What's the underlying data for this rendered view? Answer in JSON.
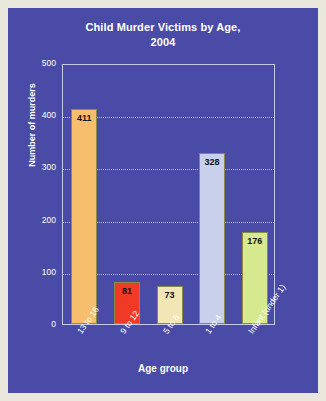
{
  "panel": {
    "background_color": "#4a4ba6",
    "page_background_color": "#eae7dd",
    "frame_color": "#c6c9e8",
    "gridline_color": "#b9bde4"
  },
  "chart_data": {
    "type": "bar",
    "title": "Child Murder Victims by Age,",
    "title_line2": "2004",
    "subtitle": "",
    "categories": [
      "13 to 16",
      "9 to 12",
      "5 to 8",
      "1 to 4",
      "Infant (under 1)"
    ],
    "values": [
      411,
      81,
      73,
      328,
      176
    ],
    "value_labels": [
      "411",
      "81",
      "73",
      "328",
      "176"
    ],
    "xlabel": "Age group",
    "ylabel": "Number of murders",
    "ylim": [
      0,
      500
    ],
    "yticks": [
      0,
      100,
      200,
      300,
      400,
      500
    ],
    "ytick_labels": [
      "0",
      "100",
      "200",
      "300",
      "400",
      "500"
    ],
    "grid": true,
    "legend": false,
    "bar_colors": [
      "#f7be6e",
      "#f03a26",
      "#f2e6b4",
      "#c9d0ec",
      "#d7e98f"
    ],
    "bar_border_color": "#8b8b45"
  }
}
